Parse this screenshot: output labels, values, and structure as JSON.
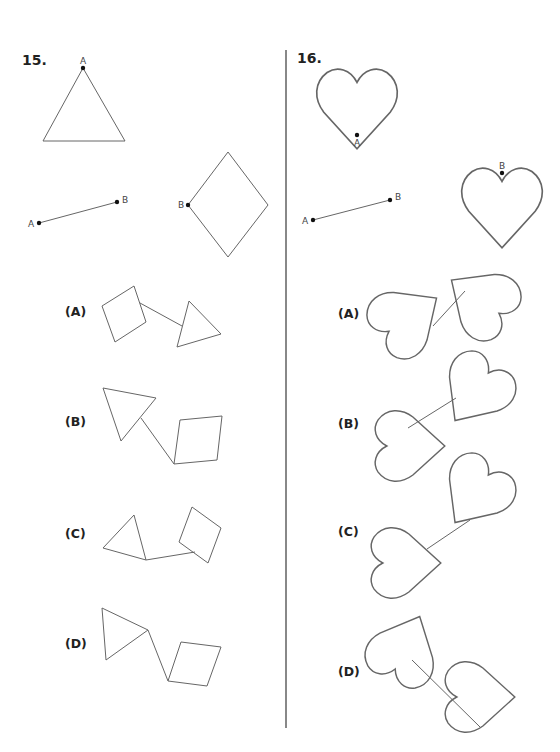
{
  "problems": [
    {
      "number": "15.",
      "given": {
        "shape_1": "equilateral-triangle",
        "shape_1_point": "A",
        "segment": {
          "start": "A",
          "end": "B"
        },
        "shape_2": "rhombus",
        "shape_2_point": "B"
      },
      "options": [
        {
          "label": "(A)",
          "description": "rhombus connected by segment to triangle"
        },
        {
          "label": "(B)",
          "description": "triangle connected by segment to rhombus"
        },
        {
          "label": "(C)",
          "description": "triangle connected by segment to rhombus"
        },
        {
          "label": "(D)",
          "description": "triangle connected by segment to rhombus"
        }
      ]
    },
    {
      "number": "16.",
      "given": {
        "shape_1": "heart",
        "shape_1_point": "A",
        "segment": {
          "start": "A",
          "end": "B"
        },
        "shape_2": "heart",
        "shape_2_point": "B"
      },
      "options": [
        {
          "label": "(A)",
          "description": "two rotated hearts joined by segment"
        },
        {
          "label": "(B)",
          "description": "two rotated hearts joined by segment"
        },
        {
          "label": "(C)",
          "description": "two rotated hearts joined by segment"
        },
        {
          "label": "(D)",
          "description": "two rotated hearts joined by segment"
        }
      ]
    }
  ],
  "point_labels": {
    "a": "A",
    "b": "B"
  }
}
